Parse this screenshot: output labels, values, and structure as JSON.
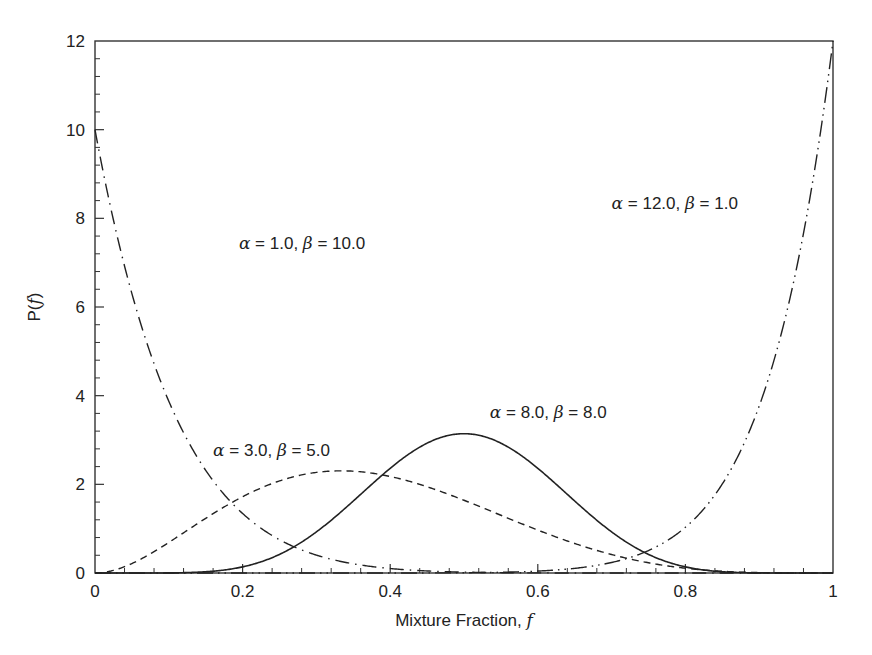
{
  "chart_data": {
    "type": "line",
    "title": "",
    "xlabel": "Mixture Fraction, f",
    "ylabel": "P(f)",
    "xlim": [
      0,
      1
    ],
    "ylim": [
      0,
      12
    ],
    "grid": false,
    "legend": "none (inline annotations)",
    "x_ticks": [
      0,
      0.2,
      0.4,
      0.6,
      0.8,
      1
    ],
    "x_tick_labels": [
      "0",
      "0.2",
      "0.4",
      "0.6",
      "0.8",
      "1"
    ],
    "x_minor_step": 0.04,
    "y_ticks": [
      0,
      2,
      4,
      6,
      8,
      10,
      12
    ],
    "y_tick_labels": [
      "0",
      "2",
      "4",
      "6",
      "8",
      "10",
      "12"
    ],
    "y_minor_step": 0.4,
    "series": [
      {
        "name": "alpha = 1.0, beta = 10.0",
        "distribution": "beta",
        "alpha": 1.0,
        "beta": 10.0,
        "line_style": "dash-dot",
        "x": [
          0,
          0.05,
          0.1,
          0.15,
          0.2,
          0.25,
          0.3,
          0.35,
          0.4,
          0.5,
          0.6,
          0.7,
          0.8,
          1.0
        ],
        "values": [
          10.0,
          6.3,
          3.87,
          2.32,
          1.34,
          0.75,
          0.4,
          0.21,
          0.1,
          0.02,
          0.003,
          0.0,
          0.0,
          0.0
        ]
      },
      {
        "name": "alpha = 3.0, beta = 5.0",
        "distribution": "beta",
        "alpha": 3.0,
        "beta": 5.0,
        "line_style": "dashed",
        "x": [
          0,
          0.1,
          0.2,
          0.3,
          0.333,
          0.4,
          0.5,
          0.6,
          0.7,
          0.8,
          0.9,
          1.0
        ],
        "values": [
          0.0,
          0.46,
          1.47,
          2.27,
          2.32,
          2.07,
          1.64,
          0.97,
          0.4,
          0.09,
          0.005,
          0.0
        ]
      },
      {
        "name": "alpha = 8.0, beta = 8.0",
        "distribution": "beta",
        "alpha": 8.0,
        "beta": 8.0,
        "line_style": "solid",
        "x": [
          0,
          0.1,
          0.2,
          0.3,
          0.4,
          0.5,
          0.6,
          0.7,
          0.8,
          0.9,
          1.0
        ],
        "values": [
          0.0,
          0.003,
          0.11,
          0.87,
          2.47,
          3.14,
          2.47,
          0.87,
          0.11,
          0.003,
          0.0
        ]
      },
      {
        "name": "alpha = 12.0, beta = 1.0",
        "distribution": "beta",
        "alpha": 12.0,
        "beta": 1.0,
        "line_style": "dash-dot-dot",
        "x": [
          0,
          0.5,
          0.6,
          0.7,
          0.75,
          0.8,
          0.85,
          0.9,
          0.95,
          1.0
        ],
        "values": [
          0.0,
          0.006,
          0.044,
          0.24,
          0.51,
          1.03,
          2.02,
          3.77,
          6.82,
          12.0
        ]
      }
    ],
    "annotations": [
      {
        "series": 0,
        "alpha_label": "α",
        "alpha_value": "1.0",
        "beta_label": "β",
        "beta_value": "10.0",
        "x": 0.195,
        "y": 7.3
      },
      {
        "series": 1,
        "alpha_label": "α",
        "alpha_value": "3.0",
        "beta_label": "β",
        "beta_value": "5.0",
        "x": 0.16,
        "y": 2.65
      },
      {
        "series": 2,
        "alpha_label": "α",
        "alpha_value": "8.0",
        "beta_label": "β",
        "beta_value": "8.0",
        "x": 0.535,
        "y": 3.5
      },
      {
        "series": 3,
        "alpha_label": "α",
        "alpha_value": "12.0",
        "beta_label": "β",
        "beta_value": "1.0",
        "x": 0.7,
        "y": 8.2
      }
    ]
  },
  "colors": {
    "line": "#222222",
    "axis": "#333333",
    "background": "#ffffff"
  }
}
